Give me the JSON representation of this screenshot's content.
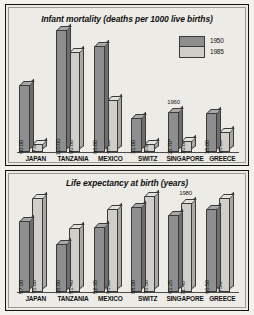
{
  "legend": {
    "items": [
      {
        "label": "1950",
        "color": "#8e8e8e"
      },
      {
        "label": "1985",
        "color": "#cfcec8"
      }
    ]
  },
  "chart_data": [
    {
      "type": "bar",
      "title": "Infant mortality (deaths per 1000 live births)",
      "xlabel": "",
      "ylabel": "",
      "ylim": [
        0,
        110
      ],
      "grid": false,
      "legend_position": "top-right",
      "categories": [
        "JAPAN",
        "TANZANIA",
        "MEXICO",
        "SWITZ",
        "SINGAPORE",
        "GREECE"
      ],
      "series": [
        {
          "name": "1950",
          "color": "#8e8e8e",
          "values": [
            60.0,
            110.0,
            96.0,
            31.0,
            35.7,
            35.0
          ],
          "labels": [
            "60.00",
            "110.00",
            "96.00",
            "31.00",
            "35.70*",
            "35.00"
          ]
        },
        {
          "name": "1985",
          "color": "#cfcec8",
          "values": [
            7.0,
            90.0,
            47.0,
            6.9,
            10.0,
            18.0
          ],
          "labels": [
            "7.00",
            "90.00",
            "47.00",
            "6.90",
            "10.00",
            "18.00"
          ]
        }
      ],
      "annotations": [
        {
          "text": "1960",
          "category": "SINGAPORE",
          "series": "1950"
        }
      ]
    },
    {
      "type": "bar",
      "title": "Life expectancy at birth (years)",
      "xlabel": "",
      "ylabel": "",
      "ylim": [
        0,
        80
      ],
      "grid": false,
      "legend_position": "none",
      "categories": [
        "JAPAN",
        "TANZANIA",
        "MEXICO",
        "SWITZ",
        "SINGAPORE",
        "GREECE"
      ],
      "series": [
        {
          "name": "1950",
          "color": "#8e8e8e",
          "values": [
            57.0,
            38.8,
            52.35,
            68.0,
            61.25,
            66.5
          ],
          "labels": [
            "57.00",
            "38.80",
            "52.35",
            "68.00",
            "61.25",
            "66.50"
          ]
        },
        {
          "name": "1985",
          "color": "#cfcec8",
          "values": [
            75.0,
            51.4,
            66.5,
            76.5,
            71.4,
            75.0
          ],
          "labels": [
            "75.00",
            "51.40",
            "66.50",
            "76.50",
            "71.40*",
            "75.0"
          ]
        }
      ],
      "annotations": [
        {
          "text": "1980",
          "category": "SINGAPORE",
          "series": "1985"
        }
      ]
    }
  ]
}
